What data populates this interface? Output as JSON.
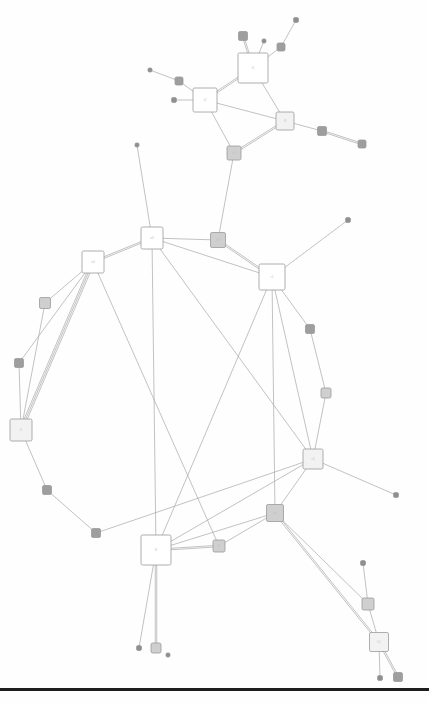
{
  "figure": {
    "kind": "node-link-network-graph",
    "width": 429,
    "height": 703,
    "background": "#ffffff",
    "title": "",
    "caption": ""
  },
  "style": {
    "edge_color": "#a8a8a8",
    "edge_width": 0.7,
    "node_stroke": "#9a9a9a",
    "node_stroke_width": 0.8,
    "label_color": "#c2c2c2",
    "label_size": 3.2,
    "hub_fill": "#ffffff",
    "large_fill": "#f2f2f2",
    "medium_fill": "#cfcfcf",
    "small_fill": "#9e9e9e",
    "dot_fill": "#8f8f8f",
    "corner_radius": 1.6
  },
  "baseline": {
    "name": "bottom-rule",
    "y": 688,
    "height": 3,
    "color": "#1d1d1d"
  },
  "chart_data": {
    "type": "graph",
    "layout": "force-directed",
    "node_count": 39,
    "edge_count": 52,
    "nodes": [
      {
        "id": "n1",
        "label": "t1",
        "x": 253,
        "y": 68,
        "size": 30,
        "class": "hub"
      },
      {
        "id": "n2",
        "label": "t2",
        "x": 205,
        "y": 100,
        "size": 24,
        "class": "hub"
      },
      {
        "id": "n3",
        "label": "t3",
        "x": 285,
        "y": 121,
        "size": 18,
        "class": "large"
      },
      {
        "id": "n4",
        "label": "e0",
        "x": 234,
        "y": 153,
        "size": 14,
        "class": "medium"
      },
      {
        "id": "n5",
        "label": "",
        "x": 243,
        "y": 36,
        "size": 9,
        "class": "small"
      },
      {
        "id": "n6",
        "label": "",
        "x": 264,
        "y": 41,
        "size": 4,
        "class": "dot"
      },
      {
        "id": "n7",
        "label": "",
        "x": 281,
        "y": 47,
        "size": 8,
        "class": "small"
      },
      {
        "id": "n8",
        "label": "",
        "x": 296,
        "y": 20,
        "size": 5,
        "class": "dot"
      },
      {
        "id": "n9",
        "label": "",
        "x": 179,
        "y": 81,
        "size": 8,
        "class": "small"
      },
      {
        "id": "n10",
        "label": "",
        "x": 150,
        "y": 70,
        "size": 4,
        "class": "dot"
      },
      {
        "id": "n11",
        "label": "",
        "x": 174,
        "y": 100,
        "size": 5,
        "class": "dot"
      },
      {
        "id": "n12",
        "label": "",
        "x": 322,
        "y": 131,
        "size": 9,
        "class": "small"
      },
      {
        "id": "n13",
        "label": "",
        "x": 362,
        "y": 144,
        "size": 8,
        "class": "small"
      },
      {
        "id": "n14",
        "label": "e3",
        "x": 152,
        "y": 238,
        "size": 22,
        "class": "hub"
      },
      {
        "id": "n15",
        "label": "e4",
        "x": 93,
        "y": 262,
        "size": 22,
        "class": "hub"
      },
      {
        "id": "n16",
        "label": "e8",
        "x": 218,
        "y": 240,
        "size": 15,
        "class": "medium"
      },
      {
        "id": "n17",
        "label": "r1",
        "x": 272,
        "y": 277,
        "size": 26,
        "class": "hub"
      },
      {
        "id": "n18",
        "label": "",
        "x": 137,
        "y": 145,
        "size": 4,
        "class": "dot"
      },
      {
        "id": "n19",
        "label": "",
        "x": 348,
        "y": 220,
        "size": 5,
        "class": "dot"
      },
      {
        "id": "n20",
        "label": "",
        "x": 45,
        "y": 303,
        "size": 11,
        "class": "medium"
      },
      {
        "id": "n21",
        "label": "",
        "x": 19,
        "y": 363,
        "size": 9,
        "class": "small"
      },
      {
        "id": "n22",
        "label": "l1",
        "x": 21,
        "y": 430,
        "size": 22,
        "class": "large"
      },
      {
        "id": "n23",
        "label": "",
        "x": 47,
        "y": 490,
        "size": 9,
        "class": "small"
      },
      {
        "id": "n24",
        "label": "",
        "x": 96,
        "y": 533,
        "size": 9,
        "class": "small"
      },
      {
        "id": "n25",
        "label": "",
        "x": 326,
        "y": 393,
        "size": 10,
        "class": "medium"
      },
      {
        "id": "n26",
        "label": "",
        "x": 310,
        "y": 329,
        "size": 9,
        "class": "small"
      },
      {
        "id": "n27",
        "label": "r4",
        "x": 313,
        "y": 459,
        "size": 20,
        "class": "large"
      },
      {
        "id": "n28",
        "label": "b4",
        "x": 275,
        "y": 513,
        "size": 17,
        "class": "medium"
      },
      {
        "id": "n29",
        "label": "f1",
        "x": 156,
        "y": 550,
        "size": 30,
        "class": "hub"
      },
      {
        "id": "n30",
        "label": "b1",
        "x": 219,
        "y": 546,
        "size": 12,
        "class": "medium"
      },
      {
        "id": "n31",
        "label": "",
        "x": 396,
        "y": 495,
        "size": 5,
        "class": "dot"
      },
      {
        "id": "n32",
        "label": "",
        "x": 363,
        "y": 563,
        "size": 5,
        "class": "dot"
      },
      {
        "id": "n33",
        "label": "",
        "x": 368,
        "y": 604,
        "size": 12,
        "class": "medium"
      },
      {
        "id": "n34",
        "label": "k1",
        "x": 379,
        "y": 642,
        "size": 19,
        "class": "large"
      },
      {
        "id": "n35",
        "label": "",
        "x": 139,
        "y": 648,
        "size": 5,
        "class": "dot"
      },
      {
        "id": "n36",
        "label": "",
        "x": 156,
        "y": 648,
        "size": 10,
        "class": "medium"
      },
      {
        "id": "n37",
        "label": "",
        "x": 380,
        "y": 678,
        "size": 5,
        "class": "dot"
      },
      {
        "id": "n38",
        "label": "",
        "x": 398,
        "y": 677,
        "size": 9,
        "class": "small"
      },
      {
        "id": "n39",
        "label": "",
        "x": 168,
        "y": 655,
        "size": 4,
        "class": "dot"
      }
    ],
    "edges": [
      {
        "source": "n1",
        "target": "n5",
        "parallel": 2
      },
      {
        "source": "n1",
        "target": "n6",
        "parallel": 1
      },
      {
        "source": "n1",
        "target": "n7",
        "parallel": 1
      },
      {
        "source": "n7",
        "target": "n8",
        "parallel": 1
      },
      {
        "source": "n1",
        "target": "n2",
        "parallel": 2
      },
      {
        "source": "n1",
        "target": "n3",
        "parallel": 1
      },
      {
        "source": "n2",
        "target": "n9",
        "parallel": 1
      },
      {
        "source": "n9",
        "target": "n10",
        "parallel": 1
      },
      {
        "source": "n2",
        "target": "n11",
        "parallel": 1
      },
      {
        "source": "n2",
        "target": "n3",
        "parallel": 1
      },
      {
        "source": "n2",
        "target": "n4",
        "parallel": 1
      },
      {
        "source": "n3",
        "target": "n4",
        "parallel": 2
      },
      {
        "source": "n3",
        "target": "n12",
        "parallel": 1
      },
      {
        "source": "n12",
        "target": "n13",
        "parallel": 2
      },
      {
        "source": "n4",
        "target": "n16",
        "parallel": 1
      },
      {
        "source": "n14",
        "target": "n15",
        "parallel": 2
      },
      {
        "source": "n14",
        "target": "n16",
        "parallel": 1
      },
      {
        "source": "n14",
        "target": "n18",
        "parallel": 1
      },
      {
        "source": "n14",
        "target": "n29",
        "parallel": 1
      },
      {
        "source": "n14",
        "target": "n17",
        "parallel": 1
      },
      {
        "source": "n16",
        "target": "n17",
        "parallel": 2
      },
      {
        "source": "n17",
        "target": "n19",
        "parallel": 1
      },
      {
        "source": "n17",
        "target": "n26",
        "parallel": 1
      },
      {
        "source": "n17",
        "target": "n29",
        "parallel": 1
      },
      {
        "source": "n17",
        "target": "n28",
        "parallel": 1
      },
      {
        "source": "n17",
        "target": "n27",
        "parallel": 1
      },
      {
        "source": "n15",
        "target": "n20",
        "parallel": 1
      },
      {
        "source": "n15",
        "target": "n21",
        "parallel": 1
      },
      {
        "source": "n15",
        "target": "n22",
        "parallel": 3
      },
      {
        "source": "n20",
        "target": "n22",
        "parallel": 1
      },
      {
        "source": "n21",
        "target": "n22",
        "parallel": 1
      },
      {
        "source": "n15",
        "target": "n30",
        "parallel": 1
      },
      {
        "source": "n22",
        "target": "n23",
        "parallel": 1
      },
      {
        "source": "n23",
        "target": "n24",
        "parallel": 1
      },
      {
        "source": "n24",
        "target": "n27",
        "parallel": 1
      },
      {
        "source": "n26",
        "target": "n25",
        "parallel": 1
      },
      {
        "source": "n25",
        "target": "n27",
        "parallel": 1
      },
      {
        "source": "n27",
        "target": "n28",
        "parallel": 1
      },
      {
        "source": "n27",
        "target": "n31",
        "parallel": 1
      },
      {
        "source": "n27",
        "target": "n29",
        "parallel": 1
      },
      {
        "source": "n28",
        "target": "n29",
        "parallel": 1
      },
      {
        "source": "n28",
        "target": "n30",
        "parallel": 1
      },
      {
        "source": "n28",
        "target": "n33",
        "parallel": 1
      },
      {
        "source": "n28",
        "target": "n34",
        "parallel": 2
      },
      {
        "source": "n29",
        "target": "n30",
        "parallel": 2
      },
      {
        "source": "n29",
        "target": "n35",
        "parallel": 1
      },
      {
        "source": "n29",
        "target": "n36",
        "parallel": 2
      },
      {
        "source": "n32",
        "target": "n33",
        "parallel": 1
      },
      {
        "source": "n33",
        "target": "n34",
        "parallel": 1
      },
      {
        "source": "n34",
        "target": "n37",
        "parallel": 1
      },
      {
        "source": "n34",
        "target": "n38",
        "parallel": 2
      },
      {
        "source": "n14",
        "target": "n27",
        "parallel": 1
      }
    ]
  }
}
